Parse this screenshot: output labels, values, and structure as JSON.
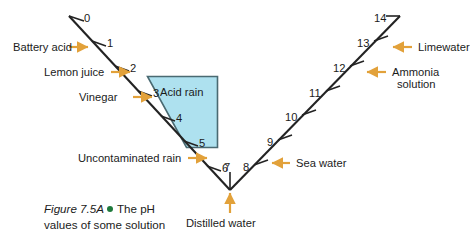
{
  "figure": {
    "number": "Figure 7.5A",
    "bullet": "green-dot",
    "caption_line1": "The pH",
    "caption_line2": "values of some solution",
    "caption_full": "The pH values of some solution"
  },
  "colors": {
    "line": "#232323",
    "arrow": "#E2A13A",
    "box_fill": "#AEE1EF",
    "box_stroke": "#4A6A72",
    "bullet": "#1E7A3C",
    "text": "#1B1B1B",
    "background": "#FFFFFF"
  },
  "scale": {
    "name": "pH scale",
    "shape": "v-line",
    "min": 0,
    "max": 14,
    "neutral": 7,
    "ticks": [
      "0",
      "1",
      "2",
      "3",
      "4",
      "5",
      "6",
      "7",
      "8",
      "9",
      "10",
      "11",
      "12",
      "13",
      "14"
    ]
  },
  "region_box": {
    "label": "Acid rain",
    "covers_ph": "3 to 5"
  },
  "labels_left": [
    {
      "text": "Battery acid",
      "ph": "1"
    },
    {
      "text": "Lemon juice",
      "ph": "2"
    },
    {
      "text": "Vinegar",
      "ph": "3"
    },
    {
      "text": "Uncontaminated rain",
      "ph": "5"
    }
  ],
  "labels_bottom": [
    {
      "text": "Distilled water",
      "ph": "7"
    }
  ],
  "labels_right": [
    {
      "text": "Sea water",
      "ph": "8"
    },
    {
      "text": "Ammonia",
      "text2": "solution",
      "ph": "12"
    },
    {
      "text": "Limewater",
      "ph": "13"
    }
  ],
  "tick_values": {
    "t0": "0",
    "t1": "1",
    "t2": "2",
    "t3": "3",
    "t4": "4",
    "t5": "5",
    "t6": "6",
    "t7": "7",
    "t8": "8",
    "t9": "9",
    "t10": "10",
    "t11": "11",
    "t12": "12",
    "t13": "13",
    "t14": "14"
  }
}
